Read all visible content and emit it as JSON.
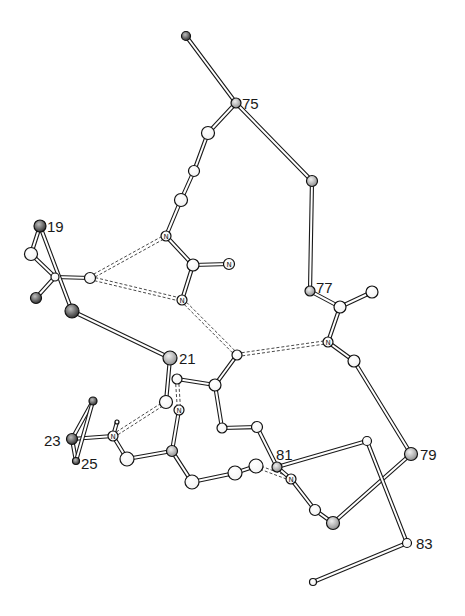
{
  "figure": {
    "background": "#ffffff",
    "colors": {
      "bond": "#1a1a1a",
      "atom_light": "#ffffff",
      "atom_dark": "#6e6e6e",
      "hbond": "#333333"
    }
  },
  "residue_labels": [
    {
      "text": "75",
      "x": 242,
      "y": 109
    },
    {
      "text": "19",
      "x": 47,
      "y": 232
    },
    {
      "text": "77",
      "x": 316,
      "y": 293
    },
    {
      "text": "21",
      "x": 179,
      "y": 364
    },
    {
      "text": "23",
      "x": 44,
      "y": 446
    },
    {
      "text": "25",
      "x": 81,
      "y": 469
    },
    {
      "text": "81",
      "x": 276,
      "y": 460
    },
    {
      "text": "79",
      "x": 420,
      "y": 460
    },
    {
      "text": "83",
      "x": 416,
      "y": 549
    }
  ],
  "atoms": [
    {
      "id": "a0",
      "x": 186,
      "y": 36,
      "r": 4.5,
      "shade": "dark",
      "label": ""
    },
    {
      "id": "a1",
      "x": 236,
      "y": 103,
      "r": 5,
      "shade": "mid",
      "label": ""
    },
    {
      "id": "a2",
      "x": 208,
      "y": 133,
      "r": 6.5,
      "shade": "light",
      "label": ""
    },
    {
      "id": "a3",
      "x": 194,
      "y": 171,
      "r": 5.5,
      "shade": "light",
      "label": ""
    },
    {
      "id": "a4",
      "x": 181,
      "y": 200,
      "r": 6.5,
      "shade": "light",
      "label": ""
    },
    {
      "id": "a5",
      "x": 166,
      "y": 236,
      "r": 5,
      "shade": "light",
      "label": "N"
    },
    {
      "id": "a6",
      "x": 193,
      "y": 265,
      "r": 6,
      "shade": "light",
      "label": ""
    },
    {
      "id": "a7",
      "x": 229,
      "y": 264,
      "r": 5.5,
      "shade": "light",
      "label": "N"
    },
    {
      "id": "a8",
      "x": 182,
      "y": 300,
      "r": 5,
      "shade": "light",
      "label": "N"
    },
    {
      "id": "a9",
      "x": 312,
      "y": 181,
      "r": 5.5,
      "shade": "mid",
      "label": ""
    },
    {
      "id": "a10",
      "x": 310,
      "y": 291,
      "r": 5,
      "shade": "mid",
      "label": ""
    },
    {
      "id": "a11",
      "x": 340,
      "y": 307,
      "r": 6,
      "shade": "light",
      "label": ""
    },
    {
      "id": "a12",
      "x": 372,
      "y": 292,
      "r": 6,
      "shade": "light",
      "label": ""
    },
    {
      "id": "a13",
      "x": 328,
      "y": 342,
      "r": 5,
      "shade": "light",
      "label": "N"
    },
    {
      "id": "a14",
      "x": 354,
      "y": 361,
      "r": 6,
      "shade": "light",
      "label": ""
    },
    {
      "id": "a15",
      "x": 411,
      "y": 454,
      "r": 6.5,
      "shade": "mid",
      "label": ""
    },
    {
      "id": "a16",
      "x": 407,
      "y": 543,
      "r": 4.5,
      "shade": "light",
      "label": ""
    },
    {
      "id": "a17",
      "x": 313,
      "y": 582,
      "r": 3.5,
      "shade": "light",
      "label": ""
    },
    {
      "id": "a18",
      "x": 40,
      "y": 226,
      "r": 6,
      "shade": "dark",
      "label": ""
    },
    {
      "id": "a19",
      "x": 31,
      "y": 254,
      "r": 6.5,
      "shade": "light",
      "label": ""
    },
    {
      "id": "a20",
      "x": 55,
      "y": 277,
      "r": 4,
      "shade": "light",
      "label": ""
    },
    {
      "id": "a21",
      "x": 36,
      "y": 298,
      "r": 5.5,
      "shade": "dark",
      "label": ""
    },
    {
      "id": "a22",
      "x": 72,
      "y": 311,
      "r": 7,
      "shade": "dark",
      "label": ""
    },
    {
      "id": "a23",
      "x": 90,
      "y": 278,
      "r": 5.5,
      "shade": "light",
      "label": ""
    },
    {
      "id": "a24",
      "x": 170,
      "y": 358,
      "r": 7,
      "shade": "mid",
      "label": ""
    },
    {
      "id": "a25",
      "x": 237,
      "y": 355,
      "r": 5,
      "shade": "light",
      "label": ""
    },
    {
      "id": "a26",
      "x": 215,
      "y": 385,
      "r": 6,
      "shade": "light",
      "label": ""
    },
    {
      "id": "a27",
      "x": 177,
      "y": 379,
      "r": 5,
      "shade": "light",
      "label": ""
    },
    {
      "id": "a28",
      "x": 166,
      "y": 402,
      "r": 6.5,
      "shade": "light",
      "label": ""
    },
    {
      "id": "a29",
      "x": 179,
      "y": 410,
      "r": 5,
      "shade": "light",
      "label": "N"
    },
    {
      "id": "a30",
      "x": 222,
      "y": 428,
      "r": 5,
      "shade": "light",
      "label": ""
    },
    {
      "id": "a31",
      "x": 257,
      "y": 427,
      "r": 5.5,
      "shade": "light",
      "label": ""
    },
    {
      "id": "a32",
      "x": 172,
      "y": 451,
      "r": 5.5,
      "shade": "mid",
      "label": ""
    },
    {
      "id": "a33",
      "x": 127,
      "y": 459,
      "r": 7,
      "shade": "light",
      "label": ""
    },
    {
      "id": "a34",
      "x": 113,
      "y": 436,
      "r": 5,
      "shade": "light",
      "label": "N"
    },
    {
      "id": "a35",
      "x": 72,
      "y": 439,
      "r": 5.5,
      "shade": "dark",
      "label": ""
    },
    {
      "id": "a36",
      "x": 93,
      "y": 401,
      "r": 4,
      "shade": "dark",
      "label": ""
    },
    {
      "id": "a37",
      "x": 76,
      "y": 461,
      "r": 3.5,
      "shade": "dark",
      "label": ""
    },
    {
      "id": "a38",
      "x": 117,
      "y": 422,
      "r": 2,
      "shade": "light",
      "label": ""
    },
    {
      "id": "a39",
      "x": 192,
      "y": 482,
      "r": 7,
      "shade": "light",
      "label": ""
    },
    {
      "id": "a40",
      "x": 235,
      "y": 473,
      "r": 7,
      "shade": "light",
      "label": ""
    },
    {
      "id": "a41",
      "x": 256,
      "y": 466,
      "r": 7,
      "shade": "light",
      "label": ""
    },
    {
      "id": "a42",
      "x": 277,
      "y": 467,
      "r": 5,
      "shade": "mid",
      "label": ""
    },
    {
      "id": "a43",
      "x": 291,
      "y": 479,
      "r": 5,
      "shade": "light",
      "label": "N"
    },
    {
      "id": "a44",
      "x": 315,
      "y": 510,
      "r": 5.5,
      "shade": "light",
      "label": ""
    },
    {
      "id": "a45",
      "x": 333,
      "y": 523,
      "r": 6.5,
      "shade": "mid",
      "label": ""
    },
    {
      "id": "a46",
      "x": 367,
      "y": 441,
      "r": 4.5,
      "shade": "light",
      "label": ""
    }
  ],
  "bonds": [
    [
      "a0",
      "a1"
    ],
    [
      "a1",
      "a2"
    ],
    [
      "a2",
      "a3"
    ],
    [
      "a3",
      "a4"
    ],
    [
      "a4",
      "a5"
    ],
    [
      "a5",
      "a6"
    ],
    [
      "a6",
      "a7"
    ],
    [
      "a6",
      "a8"
    ],
    [
      "a1",
      "a9"
    ],
    [
      "a9",
      "a10"
    ],
    [
      "a10",
      "a11"
    ],
    [
      "a11",
      "a12"
    ],
    [
      "a11",
      "a13"
    ],
    [
      "a13",
      "a14"
    ],
    [
      "a14",
      "a15"
    ],
    [
      "a15",
      "a45"
    ],
    [
      "a45",
      "a44"
    ],
    [
      "a44",
      "a43"
    ],
    [
      "a43",
      "a42"
    ],
    [
      "a42",
      "a46"
    ],
    [
      "a46",
      "a16"
    ],
    [
      "a16",
      "a17"
    ],
    [
      "a18",
      "a19"
    ],
    [
      "a19",
      "a20"
    ],
    [
      "a20",
      "a21"
    ],
    [
      "a20",
      "a23"
    ],
    [
      "a18",
      "a22"
    ],
    [
      "a22",
      "a24"
    ],
    [
      "a24",
      "a28"
    ],
    [
      "a27",
      "a26"
    ],
    [
      "a26",
      "a25"
    ],
    [
      "a26",
      "a30"
    ],
    [
      "a30",
      "a31"
    ],
    [
      "a31",
      "a42"
    ],
    [
      "a29",
      "a32"
    ],
    [
      "a32",
      "a33"
    ],
    [
      "a33",
      "a34"
    ],
    [
      "a34",
      "a35"
    ],
    [
      "a35",
      "a36"
    ],
    [
      "a35",
      "a37"
    ],
    [
      "a36",
      "a37"
    ],
    [
      "a34",
      "a38"
    ],
    [
      "a32",
      "a39"
    ],
    [
      "a39",
      "a40"
    ],
    [
      "a40",
      "a41"
    ]
  ],
  "hbonds": [
    [
      "a23",
      "a5"
    ],
    [
      "a23",
      "a8"
    ],
    [
      "a8",
      "a25"
    ],
    [
      "a25",
      "a13"
    ],
    [
      "a34",
      "a28"
    ],
    [
      "a27",
      "a29"
    ],
    [
      "a41",
      "a43"
    ]
  ]
}
